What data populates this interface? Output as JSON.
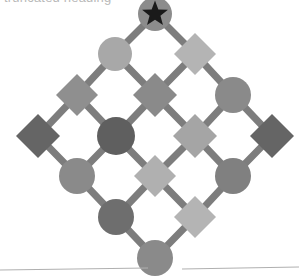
{
  "figure": {
    "title_fragment": "truncated heading",
    "type": "lattice-graph",
    "width": 299,
    "height": 277,
    "background_color": "#ffffff",
    "edge_color": "#7d7d7d",
    "edge_width": 7,
    "star_marker": {
      "present": true,
      "color": "#1a1a1a",
      "points": 5,
      "on_node_id": "n-r0-c0",
      "label": "star-marker"
    },
    "palette": {
      "dark_gray": "#5f5f5f",
      "mid_dark_gray": "#707070",
      "mid_gray": "#858585",
      "light_mid_gray": "#999999",
      "light_gray": "#a8a8a8",
      "pale_gray": "#bcbcbc"
    },
    "nodes": [
      {
        "id": "n-r0-c0",
        "shape": "circle",
        "cx": 155,
        "cy": 14,
        "size": 34,
        "color": "#8c8c8c",
        "star": true,
        "name": "node-circle-apex-star"
      },
      {
        "id": "n-r1-c0",
        "shape": "circle",
        "cx": 115,
        "cy": 54,
        "size": 34,
        "color": "#a8a8a8",
        "star": false,
        "name": "node-circle-upper-left"
      },
      {
        "id": "n-r1-c1",
        "shape": "diamond",
        "cx": 195,
        "cy": 54,
        "size": 42,
        "color": "#b4b4b4",
        "star": false,
        "name": "node-diamond-upper-right"
      },
      {
        "id": "n-r2-c0",
        "shape": "diamond",
        "cx": 77,
        "cy": 95,
        "size": 42,
        "color": "#8f8f8f",
        "star": false,
        "name": "node-diamond-left-upper"
      },
      {
        "id": "n-r2-c1",
        "shape": "diamond",
        "cx": 155,
        "cy": 95,
        "size": 44,
        "color": "#8a8a8a",
        "star": false,
        "name": "node-diamond-center-upper"
      },
      {
        "id": "n-r2-c2",
        "shape": "circle",
        "cx": 233,
        "cy": 95,
        "size": 36,
        "color": "#8a8a8a",
        "star": false,
        "name": "node-circle-right-upper"
      },
      {
        "id": "n-r3-c0",
        "shape": "diamond",
        "cx": 38,
        "cy": 136,
        "size": 44,
        "color": "#656565",
        "star": false,
        "name": "node-diamond-far-left"
      },
      {
        "id": "n-r3-c1",
        "shape": "circle",
        "cx": 116,
        "cy": 136,
        "size": 38,
        "color": "#5f5f5f",
        "star": false,
        "name": "node-circle-center-left"
      },
      {
        "id": "n-r3-c2",
        "shape": "diamond",
        "cx": 195,
        "cy": 136,
        "size": 44,
        "color": "#a5a5a5",
        "star": false,
        "name": "node-diamond-center-right"
      },
      {
        "id": "n-r3-c3",
        "shape": "diamond",
        "cx": 272,
        "cy": 136,
        "size": 44,
        "color": "#656565",
        "star": false,
        "name": "node-diamond-far-right"
      },
      {
        "id": "n-r4-c0",
        "shape": "circle",
        "cx": 77,
        "cy": 176,
        "size": 36,
        "color": "#8a8a8a",
        "star": false,
        "name": "node-circle-left-lower"
      },
      {
        "id": "n-r4-c1",
        "shape": "diamond",
        "cx": 155,
        "cy": 176,
        "size": 42,
        "color": "#b0b0b0",
        "star": false,
        "name": "node-diamond-center-lower"
      },
      {
        "id": "n-r4-c2",
        "shape": "circle",
        "cx": 233,
        "cy": 176,
        "size": 36,
        "color": "#808080",
        "star": false,
        "name": "node-circle-right-lower"
      },
      {
        "id": "n-r5-c0",
        "shape": "circle",
        "cx": 116,
        "cy": 217,
        "size": 36,
        "color": "#6e6e6e",
        "star": false,
        "name": "node-circle-lower-left"
      },
      {
        "id": "n-r5-c1",
        "shape": "diamond",
        "cx": 195,
        "cy": 217,
        "size": 42,
        "color": "#b4b4b4",
        "star": false,
        "name": "node-diamond-lower-right"
      },
      {
        "id": "n-r6-c0",
        "shape": "circle",
        "cx": 155,
        "cy": 258,
        "size": 36,
        "color": "#8a8a8a",
        "star": false,
        "name": "node-circle-bottom-apex"
      }
    ],
    "edges": [
      {
        "from": "n-r0-c0",
        "to": "n-r1-c0",
        "name": "edge-apex-to-upper-left"
      },
      {
        "from": "n-r0-c0",
        "to": "n-r1-c1",
        "name": "edge-apex-to-upper-right"
      },
      {
        "from": "n-r1-c0",
        "to": "n-r2-c0",
        "name": "edge-upper-left-to-left-upper"
      },
      {
        "from": "n-r1-c0",
        "to": "n-r2-c1",
        "name": "edge-upper-left-to-center-upper"
      },
      {
        "from": "n-r1-c1",
        "to": "n-r2-c1",
        "name": "edge-upper-right-to-center-upper"
      },
      {
        "from": "n-r1-c1",
        "to": "n-r2-c2",
        "name": "edge-upper-right-to-right-upper"
      },
      {
        "from": "n-r2-c0",
        "to": "n-r3-c0",
        "name": "edge-left-upper-to-far-left"
      },
      {
        "from": "n-r2-c0",
        "to": "n-r3-c1",
        "name": "edge-left-upper-to-center-left"
      },
      {
        "from": "n-r2-c1",
        "to": "n-r3-c1",
        "name": "edge-center-upper-to-center-left"
      },
      {
        "from": "n-r2-c1",
        "to": "n-r3-c2",
        "name": "edge-center-upper-to-center-right"
      },
      {
        "from": "n-r2-c2",
        "to": "n-r3-c2",
        "name": "edge-right-upper-to-center-right"
      },
      {
        "from": "n-r2-c2",
        "to": "n-r3-c3",
        "name": "edge-right-upper-to-far-right"
      },
      {
        "from": "n-r3-c0",
        "to": "n-r4-c0",
        "name": "edge-far-left-to-left-lower"
      },
      {
        "from": "n-r3-c1",
        "to": "n-r4-c0",
        "name": "edge-center-left-to-left-lower"
      },
      {
        "from": "n-r3-c1",
        "to": "n-r4-c1",
        "name": "edge-center-left-to-center-lower"
      },
      {
        "from": "n-r3-c2",
        "to": "n-r4-c1",
        "name": "edge-center-right-to-center-lower"
      },
      {
        "from": "n-r3-c2",
        "to": "n-r4-c2",
        "name": "edge-center-right-to-right-lower"
      },
      {
        "from": "n-r3-c3",
        "to": "n-r4-c2",
        "name": "edge-far-right-to-right-lower"
      },
      {
        "from": "n-r4-c0",
        "to": "n-r5-c0",
        "name": "edge-left-lower-to-lower-left"
      },
      {
        "from": "n-r4-c1",
        "to": "n-r5-c0",
        "name": "edge-center-lower-to-lower-left"
      },
      {
        "from": "n-r4-c1",
        "to": "n-r5-c1",
        "name": "edge-center-lower-to-lower-right"
      },
      {
        "from": "n-r4-c2",
        "to": "n-r5-c1",
        "name": "edge-right-lower-to-lower-right"
      },
      {
        "from": "n-r5-c0",
        "to": "n-r6-c0",
        "name": "edge-lower-left-to-bottom-apex"
      },
      {
        "from": "n-r5-c1",
        "to": "n-r6-c0",
        "name": "edge-lower-right-to-bottom-apex"
      }
    ],
    "rules": [
      {
        "x1": 0,
        "y1": 270,
        "x2": 148,
        "y2": 268,
        "color": "#b0b0b0",
        "name": "footer-rule-left"
      },
      {
        "x1": 182,
        "y1": 269,
        "x2": 299,
        "y2": 267,
        "color": "#b0b0b0",
        "name": "footer-rule-right"
      }
    ]
  }
}
